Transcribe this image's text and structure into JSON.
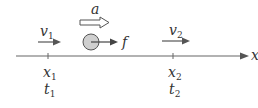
{
  "diagram": {
    "axis": {
      "label": "x"
    },
    "acceleration": {
      "label": "a"
    },
    "friction": {
      "label": "f"
    },
    "point1": {
      "velocity": {
        "symbol": "v",
        "sub": "1"
      },
      "position": {
        "symbol": "x",
        "sub": "1"
      },
      "time": {
        "symbol": "t",
        "sub": "1"
      }
    },
    "point2": {
      "velocity": {
        "symbol": "v",
        "sub": "2"
      },
      "position": {
        "symbol": "x",
        "sub": "2"
      },
      "time": {
        "symbol": "t",
        "sub": "2"
      }
    },
    "colors": {
      "line": "#555555",
      "ball_fill": "#cfcfcf",
      "ball_stroke": "#555555",
      "text": "#333333"
    }
  }
}
